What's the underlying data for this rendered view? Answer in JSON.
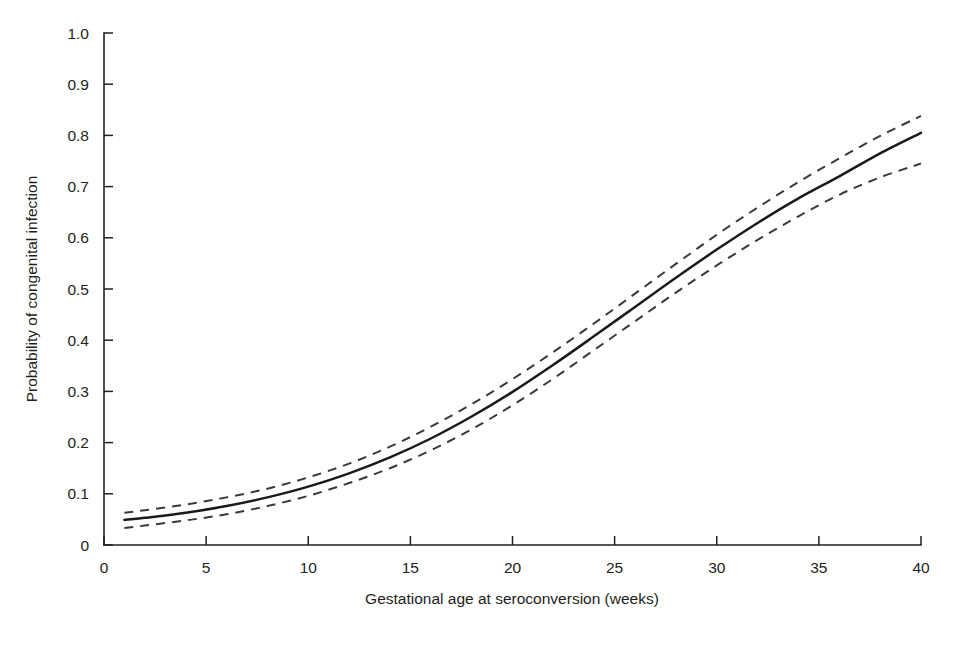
{
  "figure": {
    "background_color": "#ffffff",
    "ink_color": "#231f20"
  },
  "axes": {
    "x_title": "Gestational age at seroconversion (weeks)",
    "y_title": "Probability of congenital infection",
    "x_tick_labels": [
      "0",
      "5",
      "10",
      "15",
      "20",
      "25",
      "30",
      "35",
      "40"
    ],
    "y_tick_labels": [
      "0",
      "0.1",
      "0.2",
      "0.3",
      "0.4",
      "0.5",
      "0.6",
      "0.7",
      "0.8",
      "0.9",
      "1.0"
    ]
  },
  "ghost": {
    "bleed_through": "                                                                                                                                                                                             "
  },
  "chart_data": {
    "type": "line",
    "title": "",
    "xlabel": "Gestational age at seroconversion (weeks)",
    "ylabel": "Probability of congenital infection",
    "xlim": [
      0,
      40
    ],
    "ylim": [
      0,
      1.0
    ],
    "xticks": [
      0,
      5,
      10,
      15,
      20,
      25,
      30,
      35,
      40
    ],
    "yticks": [
      0,
      0.1,
      0.2,
      0.3,
      0.4,
      0.5,
      0.6,
      0.7,
      0.8,
      0.9,
      1.0
    ],
    "grid": false,
    "legend": false,
    "x": [
      1,
      2,
      4,
      6,
      8,
      10,
      12,
      14,
      16,
      18,
      20,
      22,
      24,
      26,
      28,
      30,
      32,
      34,
      36,
      38,
      40
    ],
    "series": [
      {
        "name": "Estimated probability",
        "style": "solid",
        "color": "#1a1a1a",
        "values": [
          0.049,
          0.053,
          0.063,
          0.076,
          0.093,
          0.114,
          0.14,
          0.171,
          0.208,
          0.251,
          0.299,
          0.352,
          0.408,
          0.465,
          0.522,
          0.577,
          0.629,
          0.677,
          0.72,
          0.765,
          0.805
        ]
      },
      {
        "name": "Upper 95% confidence limit",
        "style": "dashed",
        "color": "#3a3a3a",
        "values": [
          0.063,
          0.068,
          0.079,
          0.093,
          0.11,
          0.132,
          0.159,
          0.192,
          0.231,
          0.275,
          0.324,
          0.377,
          0.433,
          0.491,
          0.549,
          0.606,
          0.659,
          0.709,
          0.755,
          0.799,
          0.838
        ]
      },
      {
        "name": "Lower 95% confidence limit",
        "style": "dashed",
        "color": "#3a3a3a",
        "values": [
          0.033,
          0.038,
          0.048,
          0.06,
          0.076,
          0.096,
          0.121,
          0.15,
          0.185,
          0.226,
          0.273,
          0.325,
          0.381,
          0.437,
          0.493,
          0.546,
          0.596,
          0.642,
          0.684,
          0.718,
          0.745
        ]
      }
    ]
  }
}
